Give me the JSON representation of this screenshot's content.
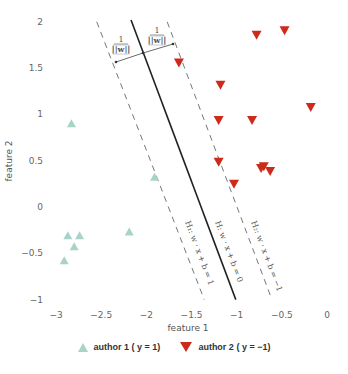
{
  "chart_data": {
    "type": "scatter",
    "title": "",
    "xlabel": "feature 1",
    "ylabel": "feature 2",
    "xlim": [
      -3.1,
      0.1
    ],
    "ylim": [
      -1.05,
      2.05
    ],
    "grid": false,
    "legend_position": "bottom",
    "x_ticks": [
      "−3",
      "−2.5",
      "−2",
      "−1.5",
      "−1",
      "−0.5",
      "0"
    ],
    "y_ticks": [
      "2",
      "1.5",
      "1",
      "0.5",
      "0",
      "−0.5",
      "−1"
    ],
    "series": [
      {
        "name": "author 1 (y = 1)",
        "marker": "triangle-up",
        "color": "#a7d3c8",
        "points": [
          [
            -2.83,
            0.9
          ],
          [
            -1.91,
            0.32
          ],
          [
            -2.87,
            -0.31
          ],
          [
            -2.74,
            -0.31
          ],
          [
            -2.8,
            -0.43
          ],
          [
            -2.19,
            -0.27
          ],
          [
            -2.91,
            -0.58
          ]
        ]
      },
      {
        "name": "author 2 (y = -1)",
        "marker": "triangle-down",
        "color": "#cc2a1a",
        "points": [
          [
            -0.78,
            1.86
          ],
          [
            -0.47,
            1.91
          ],
          [
            -1.64,
            1.56
          ],
          [
            -1.18,
            1.32
          ],
          [
            -0.18,
            1.08
          ],
          [
            -1.2,
            0.94
          ],
          [
            -0.83,
            0.94
          ],
          [
            -1.2,
            0.49
          ],
          [
            -0.73,
            0.42
          ],
          [
            -0.7,
            0.44
          ],
          [
            -0.63,
            0.39
          ],
          [
            -1.03,
            0.25
          ]
        ]
      }
    ],
    "lines": [
      {
        "name": "H",
        "equation": "w · x + b = 0",
        "style": "solid",
        "from": [
          -2.17,
          2.02
        ],
        "to": [
          -1.01,
          -1.0
        ]
      },
      {
        "name": "H1",
        "equation": "w · x + b = 1",
        "style": "dashed",
        "from": [
          -2.55,
          2.0
        ],
        "to": [
          -1.36,
          -1.0
        ]
      },
      {
        "name": "H2",
        "equation": "w · x + b = −1",
        "style": "dashed",
        "from": [
          -1.77,
          2.0
        ],
        "to": [
          -0.61,
          -1.0
        ]
      }
    ],
    "annotations": [
      {
        "text": "1 / ||w||",
        "position": "margin between H1 and H"
      },
      {
        "text": "1 / ||w||",
        "position": "margin between H and H2"
      }
    ]
  },
  "labels": {
    "xlabel": "feature 1",
    "ylabel": "feature 2",
    "h_label": "H: w · x + b = 0",
    "h1_label": "H₁: w · x + b = 1",
    "h2_label": "H₂: w · x + b = −1",
    "margin_num": "1",
    "margin_den": "||w||",
    "legend1": "author 1 ( y = 1)",
    "legend2": "author 2 ( y = −1)"
  }
}
